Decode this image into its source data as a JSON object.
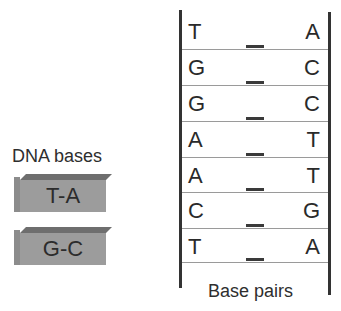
{
  "legend": {
    "title": "DNA bases",
    "blocks": [
      {
        "label": "T-A"
      },
      {
        "label": "G-C"
      }
    ]
  },
  "ladder": {
    "pairs": [
      {
        "left": "T",
        "right": "A"
      },
      {
        "left": "G",
        "right": "C"
      },
      {
        "left": "G",
        "right": "C"
      },
      {
        "left": "A",
        "right": "T"
      },
      {
        "left": "A",
        "right": "T"
      },
      {
        "left": "C",
        "right": "G"
      },
      {
        "left": "T",
        "right": "A"
      }
    ],
    "caption": "Base pairs"
  },
  "colors": {
    "block_front": "#9c9c9c",
    "block_top": "#6e6e6e",
    "block_side": "#8c8c8c",
    "rail": "#333333",
    "rung": "#9a9a9a"
  }
}
